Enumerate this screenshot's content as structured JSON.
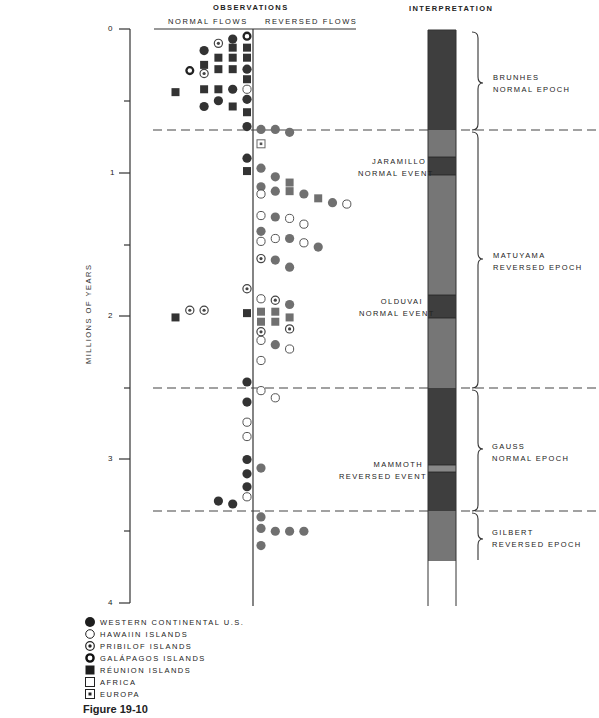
{
  "header": {
    "observations": "OBSERVATIONS",
    "normal_flows": "NORMAL  FLOWS",
    "reversed_flows": "REVERSED  FLOWS",
    "interpretation": "INTERPRETATION"
  },
  "axis": {
    "label": "MILLIONS OF YEARS",
    "ticks": [
      "0",
      "1",
      "2",
      "3",
      "4"
    ]
  },
  "events": {
    "jaramillo": [
      "JARAMILLO",
      "NORMAL EVENT"
    ],
    "olduvai": [
      "OLDUVAI",
      "NORMAL EVENT"
    ],
    "mammoth": [
      "MAMMOTH",
      "REVERSED EVENT"
    ]
  },
  "epochs": {
    "brunhes": [
      "BRUNHES",
      "NORMAL EPOCH"
    ],
    "matuyama": [
      "MATUYAMA",
      "REVERSED EPOCH"
    ],
    "gauss": [
      "GAUSS",
      "NORMAL EPOCH"
    ],
    "gilbert": [
      "GILBERT",
      "REVERSED EPOCH"
    ]
  },
  "legend": [
    {
      "symbol": "filled-circle",
      "label": "WESTERN CONTINENTAL U.S."
    },
    {
      "symbol": "open-circle",
      "label": "HAWAIIN ISLANDS"
    },
    {
      "symbol": "dotted-circle",
      "label": "PRIBILOF ISLANDS"
    },
    {
      "symbol": "thick-ring",
      "label": "GALÁPAGOS ISLANDS"
    },
    {
      "symbol": "filled-square",
      "label": "RÉUNION ISLANDS"
    },
    {
      "symbol": "open-square",
      "label": "AFRICA"
    },
    {
      "symbol": "dotted-square",
      "label": "EUROPA"
    }
  ],
  "caption": "Figure 19-10",
  "colors": {
    "normal_dark": "#3a3a3a",
    "reversed_gray": "#6e6e6e",
    "line": "#333333"
  },
  "chart_data": {
    "type": "scatter",
    "ylabel": "MILLIONS OF YEARS",
    "ylim": [
      0,
      4
    ],
    "y_ticks": [
      0,
      0.5,
      1,
      1.5,
      2,
      2.5,
      3,
      3.5,
      4
    ],
    "y_tick_labels": [
      "0",
      "",
      "1",
      "",
      "2",
      "",
      "3",
      "",
      "4"
    ],
    "columns": [
      "NORMAL FLOWS",
      "REVERSED FLOWS"
    ],
    "boundaries_myr": [
      0.7,
      2.5,
      3.35
    ],
    "polarity_column": [
      {
        "from": 0.0,
        "to": 0.7,
        "polarity": "normal",
        "name": "Brunhes Normal Epoch"
      },
      {
        "from": 0.7,
        "to": 0.89,
        "polarity": "reversed"
      },
      {
        "from": 0.89,
        "to": 1.02,
        "polarity": "normal",
        "name": "Jaramillo Normal Event"
      },
      {
        "from": 1.02,
        "to": 1.86,
        "polarity": "reversed"
      },
      {
        "from": 1.86,
        "to": 2.03,
        "polarity": "normal",
        "name": "Olduvai Normal Event"
      },
      {
        "from": 2.03,
        "to": 2.5,
        "polarity": "reversed"
      },
      {
        "from": 2.5,
        "to": 3.05,
        "polarity": "normal"
      },
      {
        "from": 3.05,
        "to": 3.12,
        "polarity": "reversed",
        "name": "Mammoth Reversed Event"
      },
      {
        "from": 3.12,
        "to": 3.35,
        "polarity": "normal"
      },
      {
        "from": 3.35,
        "to": 3.7,
        "polarity": "reversed",
        "name": "Gilbert Reversed Epoch"
      }
    ],
    "epochs": [
      {
        "name": "Brunhes Normal Epoch",
        "from": 0.0,
        "to": 0.7
      },
      {
        "name": "Matuyama Reversed Epoch",
        "from": 0.7,
        "to": 2.5
      },
      {
        "name": "Gauss Normal Epoch",
        "from": 2.5,
        "to": 3.35
      },
      {
        "name": "Gilbert Reversed Epoch",
        "from": 3.35,
        "to": 3.7
      }
    ],
    "points": [
      {
        "side": "normal",
        "col": 5,
        "myr": 0.05,
        "site": "galapagos"
      },
      {
        "side": "normal",
        "col": 4,
        "myr": 0.07,
        "site": "western_us"
      },
      {
        "side": "normal",
        "col": 3,
        "myr": 0.1,
        "site": "pribilof"
      },
      {
        "side": "normal",
        "col": 2,
        "myr": 0.15,
        "site": "western_us"
      },
      {
        "side": "normal",
        "col": 5,
        "myr": 0.13,
        "site": "reunion"
      },
      {
        "side": "normal",
        "col": 4,
        "myr": 0.13,
        "site": "reunion"
      },
      {
        "side": "normal",
        "col": 3,
        "myr": 0.2,
        "site": "reunion"
      },
      {
        "side": "normal",
        "col": 4,
        "myr": 0.2,
        "site": "reunion"
      },
      {
        "side": "normal",
        "col": 5,
        "myr": 0.2,
        "site": "reunion"
      },
      {
        "side": "normal",
        "col": 2,
        "myr": 0.25,
        "site": "reunion"
      },
      {
        "side": "normal",
        "col": 1,
        "myr": 0.29,
        "site": "galapagos"
      },
      {
        "side": "normal",
        "col": 2,
        "myr": 0.31,
        "site": "pribilof"
      },
      {
        "side": "normal",
        "col": 3,
        "myr": 0.28,
        "site": "reunion"
      },
      {
        "side": "normal",
        "col": 4,
        "myr": 0.28,
        "site": "reunion"
      },
      {
        "side": "normal",
        "col": 5,
        "myr": 0.28,
        "site": "western_us"
      },
      {
        "side": "normal",
        "col": 5,
        "myr": 0.35,
        "site": "reunion"
      },
      {
        "side": "normal",
        "col": 0,
        "myr": 0.44,
        "site": "reunion"
      },
      {
        "side": "normal",
        "col": 2,
        "myr": 0.42,
        "site": "reunion"
      },
      {
        "side": "normal",
        "col": 3,
        "myr": 0.42,
        "site": "reunion"
      },
      {
        "side": "normal",
        "col": 4,
        "myr": 0.42,
        "site": "western_us"
      },
      {
        "side": "normal",
        "col": 5,
        "myr": 0.42,
        "site": "hawaii"
      },
      {
        "side": "normal",
        "col": 5,
        "myr": 0.49,
        "site": "western_us"
      },
      {
        "side": "normal",
        "col": 3,
        "myr": 0.5,
        "site": "western_us"
      },
      {
        "side": "normal",
        "col": 2,
        "myr": 0.54,
        "site": "western_us"
      },
      {
        "side": "normal",
        "col": 4,
        "myr": 0.54,
        "site": "reunion"
      },
      {
        "side": "normal",
        "col": 5,
        "myr": 0.58,
        "site": "reunion"
      },
      {
        "side": "normal",
        "col": 5,
        "myr": 0.68,
        "site": "western_us"
      },
      {
        "side": "reversed",
        "col": 0,
        "myr": 0.7,
        "site": "western_us"
      },
      {
        "side": "reversed",
        "col": 1,
        "myr": 0.7,
        "site": "western_us"
      },
      {
        "side": "reversed",
        "col": 2,
        "myr": 0.72,
        "site": "western_us"
      },
      {
        "side": "reversed",
        "col": 0,
        "myr": 0.8,
        "site": "europa"
      },
      {
        "side": "normal",
        "col": 5,
        "myr": 0.9,
        "site": "western_us"
      },
      {
        "side": "normal",
        "col": 5,
        "myr": 0.99,
        "site": "reunion"
      },
      {
        "side": "reversed",
        "col": 0,
        "myr": 0.97,
        "site": "western_us"
      },
      {
        "side": "reversed",
        "col": 1,
        "myr": 1.03,
        "site": "western_us"
      },
      {
        "side": "reversed",
        "col": 2,
        "myr": 1.07,
        "site": "reunion"
      },
      {
        "side": "reversed",
        "col": 0,
        "myr": 1.1,
        "site": "western_us"
      },
      {
        "side": "reversed",
        "col": 0,
        "myr": 1.15,
        "site": "hawaii"
      },
      {
        "side": "reversed",
        "col": 1,
        "myr": 1.13,
        "site": "western_us"
      },
      {
        "side": "reversed",
        "col": 2,
        "myr": 1.13,
        "site": "reunion"
      },
      {
        "side": "reversed",
        "col": 3,
        "myr": 1.15,
        "site": "western_us"
      },
      {
        "side": "reversed",
        "col": 4,
        "myr": 1.18,
        "site": "reunion"
      },
      {
        "side": "reversed",
        "col": 5,
        "myr": 1.21,
        "site": "western_us"
      },
      {
        "side": "reversed",
        "col": 6,
        "myr": 1.22,
        "site": "hawaii"
      },
      {
        "side": "reversed",
        "col": 0,
        "myr": 1.3,
        "site": "hawaii"
      },
      {
        "side": "reversed",
        "col": 1,
        "myr": 1.31,
        "site": "western_us"
      },
      {
        "side": "reversed",
        "col": 2,
        "myr": 1.32,
        "site": "hawaii"
      },
      {
        "side": "reversed",
        "col": 3,
        "myr": 1.36,
        "site": "hawaii"
      },
      {
        "side": "reversed",
        "col": 0,
        "myr": 1.41,
        "site": "western_us"
      },
      {
        "side": "reversed",
        "col": 0,
        "myr": 1.48,
        "site": "hawaii"
      },
      {
        "side": "reversed",
        "col": 1,
        "myr": 1.46,
        "site": "hawaii"
      },
      {
        "side": "reversed",
        "col": 2,
        "myr": 1.46,
        "site": "western_us"
      },
      {
        "side": "reversed",
        "col": 3,
        "myr": 1.49,
        "site": "hawaii"
      },
      {
        "side": "reversed",
        "col": 4,
        "myr": 1.52,
        "site": "western_us"
      },
      {
        "side": "reversed",
        "col": 0,
        "myr": 1.6,
        "site": "pribilof"
      },
      {
        "side": "reversed",
        "col": 1,
        "myr": 1.61,
        "site": "western_us"
      },
      {
        "side": "reversed",
        "col": 2,
        "myr": 1.66,
        "site": "western_us"
      },
      {
        "side": "normal",
        "col": 5,
        "myr": 1.81,
        "site": "pribilof"
      },
      {
        "side": "normal",
        "col": 1,
        "myr": 1.96,
        "site": "pribilof"
      },
      {
        "side": "normal",
        "col": 2,
        "myr": 1.96,
        "site": "pribilof"
      },
      {
        "side": "normal",
        "col": 0,
        "myr": 2.01,
        "site": "reunion"
      },
      {
        "side": "normal",
        "col": 5,
        "myr": 1.98,
        "site": "reunion"
      },
      {
        "side": "reversed",
        "col": 0,
        "myr": 1.88,
        "site": "hawaii"
      },
      {
        "side": "reversed",
        "col": 1,
        "myr": 1.89,
        "site": "pribilof"
      },
      {
        "side": "reversed",
        "col": 2,
        "myr": 1.92,
        "site": "western_us"
      },
      {
        "side": "reversed",
        "col": 0,
        "myr": 1.97,
        "site": "reunion"
      },
      {
        "side": "reversed",
        "col": 1,
        "myr": 1.97,
        "site": "reunion"
      },
      {
        "side": "reversed",
        "col": 2,
        "myr": 2.01,
        "site": "reunion"
      },
      {
        "side": "reversed",
        "col": 0,
        "myr": 2.04,
        "site": "reunion"
      },
      {
        "side": "reversed",
        "col": 1,
        "myr": 2.04,
        "site": "reunion"
      },
      {
        "side": "reversed",
        "col": 0,
        "myr": 2.11,
        "site": "pribilof"
      },
      {
        "side": "reversed",
        "col": 2,
        "myr": 2.09,
        "site": "pribilof"
      },
      {
        "side": "reversed",
        "col": 0,
        "myr": 2.17,
        "site": "hawaii"
      },
      {
        "side": "reversed",
        "col": 1,
        "myr": 2.2,
        "site": "western_us"
      },
      {
        "side": "reversed",
        "col": 2,
        "myr": 2.23,
        "site": "hawaii"
      },
      {
        "side": "reversed",
        "col": 0,
        "myr": 2.31,
        "site": "hawaii"
      },
      {
        "side": "normal",
        "col": 5,
        "myr": 2.46,
        "site": "western_us"
      },
      {
        "side": "reversed",
        "col": 0,
        "myr": 2.52,
        "site": "hawaii"
      },
      {
        "side": "reversed",
        "col": 1,
        "myr": 2.57,
        "site": "hawaii"
      },
      {
        "side": "normal",
        "col": 5,
        "myr": 2.6,
        "site": "western_us"
      },
      {
        "side": "normal",
        "col": 5,
        "myr": 2.74,
        "site": "hawaii"
      },
      {
        "side": "normal",
        "col": 5,
        "myr": 2.84,
        "site": "hawaii"
      },
      {
        "side": "normal",
        "col": 5,
        "myr": 3.0,
        "site": "western_us"
      },
      {
        "side": "reversed",
        "col": 0,
        "myr": 3.06,
        "site": "western_us"
      },
      {
        "side": "normal",
        "col": 5,
        "myr": 3.1,
        "site": "western_us"
      },
      {
        "side": "normal",
        "col": 5,
        "myr": 3.19,
        "site": "western_us"
      },
      {
        "side": "normal",
        "col": 5,
        "myr": 3.26,
        "site": "hawaii"
      },
      {
        "side": "normal",
        "col": 3,
        "myr": 3.29,
        "site": "western_us"
      },
      {
        "side": "normal",
        "col": 4,
        "myr": 3.31,
        "site": "western_us"
      },
      {
        "side": "reversed",
        "col": 0,
        "myr": 3.4,
        "site": "western_us"
      },
      {
        "side": "reversed",
        "col": 0,
        "myr": 3.48,
        "site": "western_us"
      },
      {
        "side": "reversed",
        "col": 1,
        "myr": 3.5,
        "site": "western_us"
      },
      {
        "side": "reversed",
        "col": 2,
        "myr": 3.5,
        "site": "western_us"
      },
      {
        "side": "reversed",
        "col": 3,
        "myr": 3.5,
        "site": "western_us"
      },
      {
        "side": "reversed",
        "col": 0,
        "myr": 3.6,
        "site": "western_us"
      }
    ]
  }
}
